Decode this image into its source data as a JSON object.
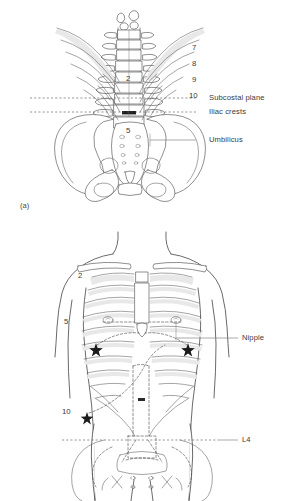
{
  "figure": {
    "panels": [
      {
        "tag": "(a)",
        "name": "posterior-skeletal-view",
        "rib_numbers": [
          "7",
          "8",
          "9",
          "10"
        ],
        "vertebra_numbers": [
          "2",
          "5"
        ],
        "reference_lines": [
          {
            "label": "Subcostal plane",
            "style": "dashed"
          },
          {
            "label": "Iliac crests",
            "style": "dashed"
          },
          {
            "label": "Umbilicus",
            "style": "leader"
          }
        ]
      },
      {
        "tag": "(b)",
        "name": "anterior-torso-view",
        "rib_numbers": [
          "2",
          "5",
          "10"
        ],
        "reference_lines": [
          {
            "label": "Nipple",
            "style": "leader"
          },
          {
            "label": "L4",
            "style": "dashed"
          }
        ]
      }
    ]
  },
  "colors": {
    "background": "#ffffff",
    "outline": "#3f3f3f",
    "bone_stroke": "#4a4a4a",
    "bone_shade": "#e8e8e8",
    "text": "#3a3a3a",
    "leader": "#777777",
    "marker": "#1c1c1c"
  }
}
